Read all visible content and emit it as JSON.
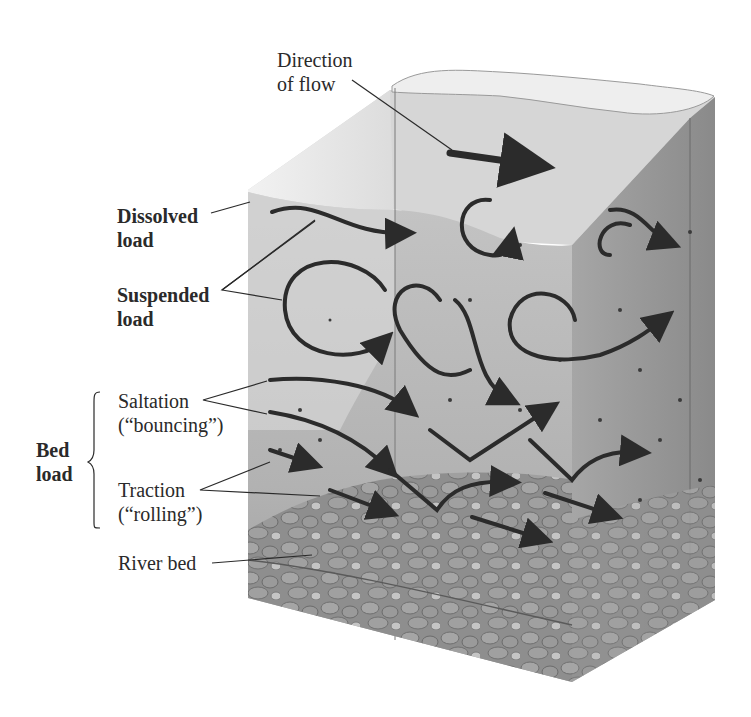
{
  "diagram": {
    "labels": {
      "direction_line1": "Direction",
      "direction_line2": "of flow",
      "dissolved_line1": "Dissolved",
      "dissolved_line2": "load",
      "suspended_line1": "Suspended",
      "suspended_line2": "load",
      "saltation_line1": "Saltation",
      "saltation_line2": "(“bouncing”)",
      "bedload_line1": "Bed",
      "bedload_line2": "load",
      "traction_line1": "Traction",
      "traction_line2": "(“rolling”)",
      "riverbed": "River bed"
    },
    "colors": {
      "background": "#ffffff",
      "water_surface": "#d9d9d9",
      "water_front": "#b8b8b8",
      "water_side": "#9a9a9a",
      "sediment": "#8a8a8a",
      "arrow": "#2b2b2b",
      "text": "#2a2a2a"
    }
  }
}
